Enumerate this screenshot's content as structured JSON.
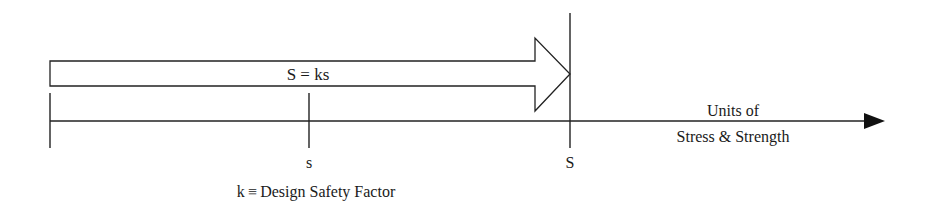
{
  "diagram": {
    "type": "stress-strength-safety-factor",
    "arrow_label": "S = ks",
    "axis_label_line1": "Units of",
    "axis_label_line2": "Stress & Strength",
    "tick_stress_label": "s",
    "tick_strength_label": "S",
    "definition": "k ≡ Design Safety Factor",
    "colors": {
      "stroke": "#222222",
      "fill": "#ffffff",
      "text": "#1a1a1a"
    }
  }
}
